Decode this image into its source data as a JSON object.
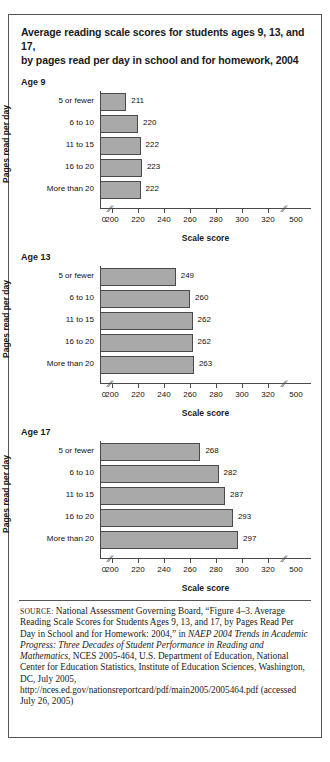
{
  "figure": {
    "title_line1": "Average reading scale scores for students ages 9, 13, and 17,",
    "title_line2": "by pages read per day in school and for homework, 2004",
    "xaxis_title": "Scale score",
    "yaxis_title": "Pages read per day",
    "axis_break_glyph": "//"
  },
  "source": {
    "label": "SOURCE:",
    "text_1": " National Assessment Governing Board, “Figure 4–3. Average Reading Scale Scores for Students Ages 9, 13, and 17, by Pages Read Per Day in School and for Homework: 2004,” in ",
    "text_italic_1": "NAEP 2004 Trends in Academic Progress: Three Decades of Student Performance in Reading and Mathematics",
    "text_2": ", NCES 2005-464, U.S. Department of Education, National Center for Education Statistics, Institute of Education Sciences, Washington, DC, July 2005, http://nces.ed.gov/nationsreportcard/pdf/main2005/2005464.pdf (accessed July 26, 2005)"
  },
  "chart_data": [
    {
      "type": "bar",
      "title": "Age 9",
      "orientation": "horizontal",
      "xlabel": "Scale score",
      "ylabel": "Pages read per day",
      "categories": [
        "5 or fewer",
        "6 to 10",
        "11 to 15",
        "16 to 20",
        "More than 20"
      ],
      "values": [
        211,
        220,
        222,
        223,
        222
      ],
      "xlim": [
        200,
        320
      ],
      "xticks": [
        0,
        200,
        220,
        240,
        260,
        280,
        300,
        320,
        500
      ],
      "axis_breaks": [
        "after 0",
        "after 320"
      ],
      "grid": false,
      "legend": "none"
    },
    {
      "type": "bar",
      "title": "Age 13",
      "orientation": "horizontal",
      "xlabel": "Scale score",
      "ylabel": "Pages read per day",
      "categories": [
        "5 or fewer",
        "6 to 10",
        "11 to 15",
        "16 to 20",
        "More than 20"
      ],
      "values": [
        249,
        260,
        262,
        262,
        263
      ],
      "xlim": [
        200,
        320
      ],
      "xticks": [
        0,
        200,
        220,
        240,
        260,
        280,
        300,
        320,
        500
      ],
      "axis_breaks": [
        "after 0",
        "after 320"
      ],
      "grid": false,
      "legend": "none"
    },
    {
      "type": "bar",
      "title": "Age 17",
      "orientation": "horizontal",
      "xlabel": "Scale score",
      "ylabel": "Pages read per day",
      "categories": [
        "5 or fewer",
        "6 to 10",
        "11 to 15",
        "16 to 20",
        "More than 20"
      ],
      "values": [
        268,
        282,
        287,
        293,
        297
      ],
      "xlim": [
        200,
        320
      ],
      "xticks": [
        0,
        200,
        220,
        240,
        260,
        280,
        300,
        320,
        500
      ],
      "axis_breaks": [
        "after 0",
        "after 320"
      ],
      "grid": false,
      "legend": "none"
    }
  ],
  "colors": {
    "bar_fill": "#a9a9a9",
    "bar_stroke": "#4a4a4a",
    "frame": "#555555",
    "text": "#1a1a1a"
  }
}
